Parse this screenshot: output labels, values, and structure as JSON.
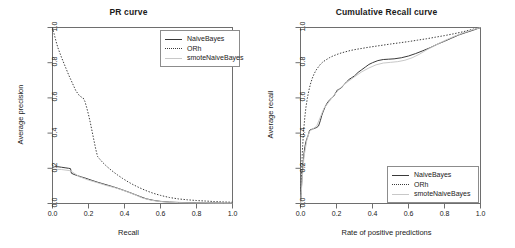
{
  "figure": {
    "panels": [
      "pr",
      "cumrecall"
    ]
  },
  "series_names": {
    "naive": "NaiveBayes",
    "orh": "ORh",
    "smote": "smoteNaiveBayes"
  },
  "pr": {
    "title": "PR curve",
    "xlabel": "Recall",
    "ylabel": "Average precision",
    "xticks": [
      "0.0",
      "0.2",
      "0.4",
      "0.6",
      "0.8",
      "1.0"
    ],
    "yticks": [
      "0.0",
      "0.2",
      "0.4",
      "0.6",
      "0.8",
      "1.0"
    ],
    "legend": [
      {
        "label": "NaiveBayes",
        "key": "solid"
      },
      {
        "label": "ORh",
        "key": "dotted"
      },
      {
        "label": "smoteNaiveBayes",
        "key": "light"
      }
    ]
  },
  "cumrecall": {
    "title": "Cumulative Recall curve",
    "xlabel": "Rate of positive predictions",
    "ylabel": "Average recall",
    "xticks": [
      "0.0",
      "0.2",
      "0.4",
      "0.6",
      "0.8",
      "1.0"
    ],
    "yticks": [
      "0.0",
      "0.2",
      "0.4",
      "0.6",
      "0.8",
      "1.0"
    ],
    "legend": [
      {
        "label": "NaiveBayes",
        "key": "solid"
      },
      {
        "label": "ORh",
        "key": "dotted"
      },
      {
        "label": "smoteNaiveBayes",
        "key": "light"
      }
    ]
  },
  "chart_data": [
    {
      "type": "line",
      "title": "PR curve",
      "xlabel": "Recall",
      "ylabel": "Average precision",
      "xlim": [
        0,
        1
      ],
      "ylim": [
        0,
        1
      ],
      "grid": false,
      "legend_position": "top-right",
      "series": [
        {
          "name": "NaiveBayes",
          "style": "solid",
          "color": "#3a3a3a",
          "x": [
            0.0,
            0.01,
            0.02,
            0.03,
            0.05,
            0.07,
            0.09,
            0.1,
            0.105,
            0.12,
            0.14,
            0.16,
            0.18,
            0.2,
            0.22,
            0.25,
            0.28,
            0.31,
            0.34,
            0.37,
            0.4,
            0.43,
            0.46,
            0.49,
            0.52,
            0.56,
            0.6,
            0.65,
            0.7,
            0.75,
            0.8,
            0.85,
            0.9,
            0.95,
            1.0
          ],
          "y": [
            0.205,
            0.208,
            0.21,
            0.209,
            0.206,
            0.203,
            0.2,
            0.198,
            0.172,
            0.165,
            0.158,
            0.151,
            0.145,
            0.138,
            0.131,
            0.121,
            0.112,
            0.103,
            0.094,
            0.084,
            0.073,
            0.062,
            0.05,
            0.038,
            0.027,
            0.018,
            0.012,
            0.008,
            0.006,
            0.005,
            0.004,
            0.003,
            0.003,
            0.002,
            0.002
          ]
        },
        {
          "name": "ORh",
          "style": "dotted",
          "color": "#3a3a3a",
          "x": [
            0.0,
            0.01,
            0.02,
            0.03,
            0.05,
            0.07,
            0.09,
            0.11,
            0.13,
            0.15,
            0.16,
            0.17,
            0.18,
            0.19,
            0.2,
            0.21,
            0.22,
            0.23,
            0.24,
            0.25,
            0.26,
            0.28,
            0.3,
            0.33,
            0.36,
            0.39,
            0.42,
            0.45,
            0.48,
            0.52,
            0.56,
            0.6,
            0.65,
            0.7,
            0.75,
            0.8,
            0.85,
            0.9,
            0.95,
            1.0
          ],
          "y": [
            1.0,
            0.96,
            0.92,
            0.885,
            0.83,
            0.78,
            0.73,
            0.685,
            0.64,
            0.612,
            0.605,
            0.6,
            0.58,
            0.545,
            0.505,
            0.46,
            0.41,
            0.36,
            0.31,
            0.268,
            0.255,
            0.232,
            0.212,
            0.186,
            0.163,
            0.142,
            0.123,
            0.106,
            0.091,
            0.073,
            0.058,
            0.046,
            0.034,
            0.026,
            0.021,
            0.017,
            0.014,
            0.011,
            0.009,
            0.007
          ]
        },
        {
          "name": "smoteNaiveBayes",
          "style": "solid-light",
          "color": "#c8c8c8",
          "x": [
            0.0,
            0.05,
            0.1,
            0.15,
            0.2,
            0.25,
            0.3,
            0.35,
            0.4,
            0.45,
            0.5,
            0.55,
            0.6,
            0.65,
            0.7,
            0.75,
            0.8,
            0.85,
            0.9,
            0.95,
            1.0
          ],
          "y": [
            0.195,
            0.193,
            0.186,
            0.152,
            0.133,
            0.118,
            0.102,
            0.089,
            0.072,
            0.053,
            0.031,
            0.018,
            0.011,
            0.007,
            0.005,
            0.004,
            0.003,
            0.003,
            0.002,
            0.002,
            0.002
          ]
        }
      ]
    },
    {
      "type": "line",
      "title": "Cumulative Recall curve",
      "xlabel": "Rate of positive predictions",
      "ylabel": "Average recall",
      "xlim": [
        0,
        1
      ],
      "ylim": [
        0,
        1
      ],
      "grid": false,
      "legend_position": "bottom-right",
      "series": [
        {
          "name": "NaiveBayes",
          "style": "solid",
          "color": "#3a3a3a",
          "x": [
            0.0,
            0.004,
            0.008,
            0.012,
            0.016,
            0.02,
            0.025,
            0.03,
            0.036,
            0.042,
            0.05,
            0.058,
            0.064,
            0.07,
            0.08,
            0.09,
            0.1,
            0.11,
            0.118,
            0.125,
            0.135,
            0.145,
            0.155,
            0.165,
            0.175,
            0.185,
            0.195,
            0.205,
            0.215,
            0.225,
            0.24,
            0.255,
            0.27,
            0.285,
            0.3,
            0.32,
            0.34,
            0.36,
            0.38,
            0.4,
            0.43,
            0.46,
            0.49,
            0.52,
            0.56,
            0.6,
            0.64,
            0.68,
            0.72,
            0.76,
            0.8,
            0.84,
            0.88,
            0.92,
            0.96,
            1.0
          ],
          "y": [
            0.0,
            0.07,
            0.14,
            0.2,
            0.25,
            0.29,
            0.325,
            0.35,
            0.37,
            0.385,
            0.415,
            0.42,
            0.422,
            0.424,
            0.428,
            0.432,
            0.44,
            0.47,
            0.5,
            0.52,
            0.545,
            0.565,
            0.58,
            0.592,
            0.6,
            0.61,
            0.628,
            0.645,
            0.65,
            0.655,
            0.672,
            0.69,
            0.705,
            0.715,
            0.725,
            0.745,
            0.76,
            0.775,
            0.79,
            0.8,
            0.812,
            0.818,
            0.82,
            0.822,
            0.828,
            0.838,
            0.852,
            0.868,
            0.885,
            0.905,
            0.922,
            0.94,
            0.958,
            0.972,
            0.985,
            1.0
          ]
        },
        {
          "name": "ORh",
          "style": "dotted",
          "color": "#3a3a3a",
          "x": [
            0.0,
            0.004,
            0.008,
            0.012,
            0.018,
            0.024,
            0.03,
            0.038,
            0.046,
            0.055,
            0.065,
            0.075,
            0.085,
            0.095,
            0.11,
            0.125,
            0.14,
            0.16,
            0.18,
            0.2,
            0.225,
            0.25,
            0.28,
            0.31,
            0.34,
            0.38,
            0.42,
            0.46,
            0.5,
            0.55,
            0.6,
            0.65,
            0.7,
            0.75,
            0.8,
            0.85,
            0.9,
            0.95,
            1.0
          ],
          "y": [
            0.0,
            0.12,
            0.24,
            0.33,
            0.42,
            0.49,
            0.545,
            0.598,
            0.64,
            0.678,
            0.71,
            0.735,
            0.755,
            0.77,
            0.79,
            0.805,
            0.815,
            0.828,
            0.838,
            0.846,
            0.855,
            0.862,
            0.87,
            0.876,
            0.881,
            0.888,
            0.894,
            0.9,
            0.906,
            0.913,
            0.92,
            0.928,
            0.936,
            0.945,
            0.954,
            0.964,
            0.975,
            0.988,
            1.0
          ]
        },
        {
          "name": "smoteNaiveBayes",
          "style": "solid-light",
          "color": "#c8c8c8",
          "x": [
            0.0,
            0.01,
            0.02,
            0.035,
            0.05,
            0.07,
            0.09,
            0.11,
            0.13,
            0.16,
            0.19,
            0.22,
            0.26,
            0.3,
            0.34,
            0.38,
            0.42,
            0.46,
            0.5,
            0.54,
            0.58,
            0.62,
            0.66,
            0.7,
            0.75,
            0.8,
            0.85,
            0.9,
            0.95,
            1.0
          ],
          "y": [
            0.0,
            0.15,
            0.27,
            0.36,
            0.41,
            0.425,
            0.44,
            0.49,
            0.54,
            0.58,
            0.62,
            0.655,
            0.69,
            0.72,
            0.748,
            0.77,
            0.788,
            0.798,
            0.802,
            0.806,
            0.814,
            0.828,
            0.848,
            0.872,
            0.9,
            0.925,
            0.948,
            0.968,
            0.985,
            1.0
          ]
        }
      ]
    }
  ]
}
